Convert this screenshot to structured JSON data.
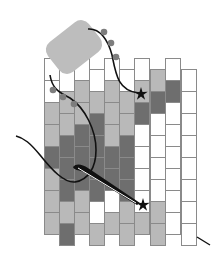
{
  "diagram": {
    "colors": {
      "white": "#ffffff",
      "light": "#b9b9b9",
      "dark": "#6e6e6e",
      "border": "#8a8a8a",
      "strap": "#bdbdbd",
      "thread": "#111111",
      "bead_on_thread": "#7d7d7d"
    },
    "grid": {
      "col_x": [
        44,
        59,
        74,
        89,
        104,
        119,
        134,
        150,
        165,
        181
      ],
      "col_width": 15,
      "row_height": 22,
      "even_col_top": 58,
      "odd_col_top": 69,
      "columns": [
        [
          "W",
          "W",
          "L",
          "L",
          "D",
          "L",
          "L",
          "L"
        ],
        [
          "W",
          "L",
          "L",
          "D",
          "D",
          "D",
          "L",
          "D"
        ],
        [
          "W",
          "L",
          "L",
          "D",
          "D",
          "D",
          "L",
          "L"
        ],
        [
          "W",
          "L",
          "D",
          "D",
          "D",
          "D",
          "W",
          "L"
        ],
        [
          "W",
          "L",
          "L",
          "L",
          "D",
          "D",
          "W",
          "L"
        ],
        [
          "W",
          "L",
          "L",
          "D",
          "D",
          "D",
          "L",
          "L"
        ],
        [
          "W",
          "L",
          "D",
          "W",
          "W",
          "W",
          "W",
          "L"
        ],
        [
          "L",
          "D",
          "W",
          "W",
          "W",
          "W",
          "L",
          "L"
        ],
        [
          "W",
          "D",
          "W",
          "W",
          "W",
          "W",
          "W",
          "W"
        ],
        [
          "W",
          "W",
          "W",
          "W",
          "W",
          "W",
          "W",
          "W"
        ]
      ]
    },
    "markers": [
      {
        "name": "star-upper",
        "x": 141,
        "y": 94
      },
      {
        "name": "star-lower",
        "x": 143,
        "y": 205
      }
    ],
    "legend": {
      "W": "white",
      "L": "light",
      "D": "dark"
    }
  }
}
